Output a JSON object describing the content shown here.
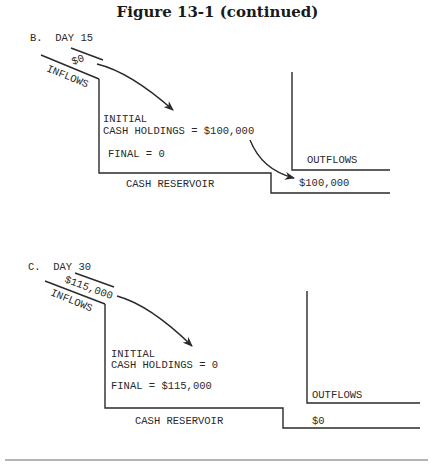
{
  "figure": {
    "title": "Figure 13-1 (continued)"
  },
  "panels": [
    {
      "label": "B.  DAY 15",
      "inflow_amount": "$0",
      "inflow_label": "INFLOWS",
      "initial_label": "INITIAL",
      "initial_value": "CASH HOLDINGS = $100,000",
      "final_value": "FINAL = 0",
      "outflow_label": "OUTFLOWS",
      "outflow_amount": "$100,000",
      "reservoir_label": "CASH RESERVOIR"
    },
    {
      "label": "C.  DAY 30",
      "inflow_amount": "$115,000",
      "inflow_label": "INFLOWS",
      "initial_label": "INITIAL",
      "initial_value": "CASH HOLDINGS = 0",
      "final_value": "FINAL = $115,000",
      "outflow_label": "OUTFLOWS",
      "outflow_amount": "$0",
      "reservoir_label": "CASH RESERVOIR"
    }
  ]
}
